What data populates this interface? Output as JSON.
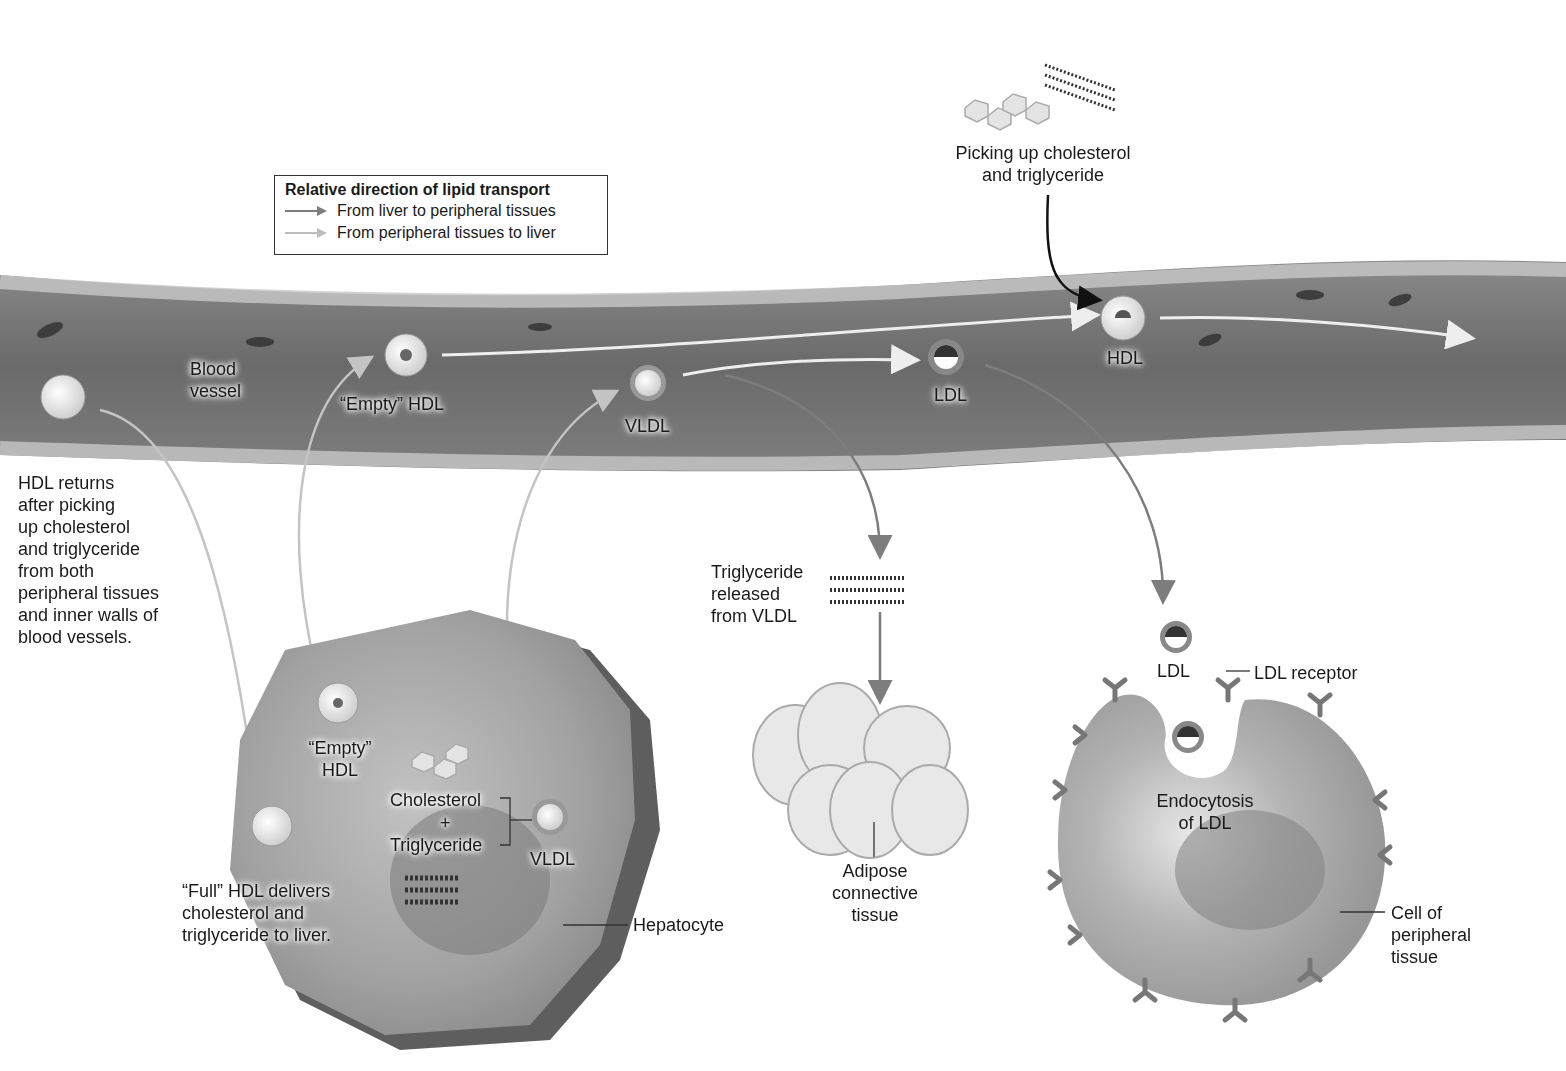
{
  "legend": {
    "title": "Relative direction of lipid transport",
    "items": [
      {
        "label": "From liver to peripheral tissues",
        "color": "#7d7d7d"
      },
      {
        "label": "From peripheral tissues to liver",
        "color": "#bdbdbd"
      }
    ]
  },
  "labels": {
    "blood_vessel": "Blood\nvessel",
    "hdl_returns": "HDL returns\nafter picking\nup cholesterol\nand triglyceride\nfrom both\nperipheral tissues\nand inner walls of\nblood vessels.",
    "empty_hdl_vessel": "“Empty” HDL",
    "vldl_vessel": "VLDL",
    "ldl_vessel": "LDL",
    "hdl_vessel": "HDL",
    "picking_up": "Picking up cholesterol\nand triglyceride",
    "empty_hdl_liver": "“Empty”\nHDL",
    "cholesterol": "Cholesterol",
    "plus": "+",
    "triglyceride": "Triglyceride",
    "vldl_liver": "VLDL",
    "full_hdl": "“Full” HDL delivers\ncholesterol and\ntriglyceride to liver.",
    "hepatocyte": "Hepatocyte",
    "trig_released": "Triglyceride\nreleased\nfrom VLDL",
    "adipose": "Adipose\nconnective\ntissue",
    "ldl_free": "LDL",
    "ldl_receptor": "LDL receptor",
    "endocytosis": "Endocytosis\nof LDL",
    "peripheral_cell": "Cell of\nperipheral\ntissue"
  },
  "colors": {
    "vessel": "#6e6e6e",
    "vessel_wall": "#bcbcbc",
    "hepatocyte": "#9a9a9a",
    "peripheral_cell": "#a4a4a4",
    "adipocyte": "#e6e6e6",
    "arrow_dark": "#7d7d7d",
    "arrow_light": "#c4c4c4"
  }
}
